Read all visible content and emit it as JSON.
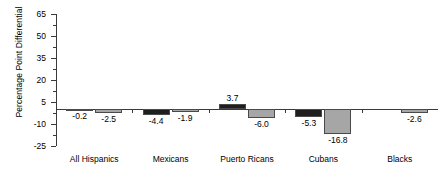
{
  "chart_data": {
    "type": "bar",
    "title": "",
    "xlabel": "",
    "ylabel": "Percentage Point Differential",
    "ylim": [
      -25,
      65
    ],
    "yticks": [
      65,
      50,
      35,
      20,
      5,
      -10,
      -25
    ],
    "ytick_labels": [
      "65",
      "50",
      "35",
      "20",
      "5",
      "-10",
      "-25"
    ],
    "grid": false,
    "legend": "none",
    "categories": [
      "All Hispanics",
      "Mexicans",
      "Puerto Ricans",
      "Cubans",
      "Blacks"
    ],
    "series": [
      {
        "name": "dark",
        "color": "#1f1f1f",
        "values": [
          -0.2,
          -4.4,
          3.7,
          -5.3,
          null
        ],
        "labels": [
          "-0.2",
          "-4.4",
          "3.7",
          "-5.3",
          ""
        ]
      },
      {
        "name": "light",
        "color": "#a6a6a6",
        "values": [
          -2.5,
          -1.9,
          -6.0,
          -16.8,
          -2.6
        ],
        "labels": [
          "-2.5",
          "-1.9",
          "-6.0",
          "-16.8",
          "-2.6"
        ]
      }
    ]
  },
  "axis": {
    "y_title": "Percentage Point Differential",
    "ticks": [
      {
        "label": "65",
        "value": 65
      },
      {
        "label": "50",
        "value": 50
      },
      {
        "label": "35",
        "value": 35
      },
      {
        "label": "20",
        "value": 20
      },
      {
        "label": "5",
        "value": 5
      },
      {
        "label": "-10",
        "value": -10
      },
      {
        "label": "-25",
        "value": -25
      }
    ]
  },
  "categories": [
    {
      "label": "All Hispanics"
    },
    {
      "label": "Mexicans"
    },
    {
      "label": "Puerto Ricans"
    },
    {
      "label": "Cubans"
    },
    {
      "label": "Blacks"
    }
  ],
  "bar_labels": {
    "all_hispanics_dark": "-0.2",
    "all_hispanics_light": "-2.5",
    "mexicans_dark": "-4.4",
    "mexicans_light": "-1.9",
    "puerto_ricans_dark": "3.7",
    "puerto_ricans_light": "-6.0",
    "cubans_dark": "-5.3",
    "cubans_light": "-16.8",
    "blacks_light": "-2.6"
  },
  "colors": {
    "dark_series": "#1f1f1f",
    "light_series": "#a6a6a6",
    "axis": "#3a3a3a",
    "background": "#ffffff"
  }
}
